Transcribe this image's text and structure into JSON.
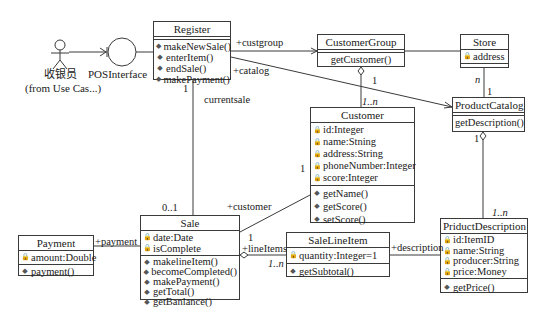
{
  "actor": {
    "name": "收银员",
    "note": "(from Use Cas...)"
  },
  "interface": {
    "name": "POSInterface"
  },
  "classes": {
    "register": {
      "name": "Register",
      "attributes": [],
      "operations": [
        "makeNewSale()",
        "enterItem()",
        "endSale()",
        "makePayment()"
      ]
    },
    "customer_group": {
      "name": "CustomerGroup",
      "attributes": [],
      "operations": [
        "getCustomer()"
      ]
    },
    "store": {
      "name": "Store",
      "attributes": [
        "address"
      ],
      "operations": []
    },
    "product_catalog": {
      "name": "ProductCatalog",
      "attributes": [],
      "operations": [
        "getDescription()"
      ]
    },
    "customer": {
      "name": "Customer",
      "attributes": [
        "id:Integer",
        "name:Stning",
        "address:String",
        "phoneNumber:Integer",
        "score:Integer"
      ],
      "operations": [
        "getName()",
        "getScore()",
        "setScore()"
      ]
    },
    "sale": {
      "name": "Sale",
      "attributes": [
        "date:Date",
        "isComplete"
      ],
      "operations": [
        "makelineItem()",
        "becomeCompleted()",
        "makePayment()",
        "getTotal()",
        "getBanlance()"
      ]
    },
    "payment": {
      "name": "Payment",
      "attributes": [
        "amount:Double"
      ],
      "operations": [
        "payment()"
      ]
    },
    "sale_line_item": {
      "name": "SaleLineItem",
      "attributes": [
        "quantity:Integer=1"
      ],
      "operations": [
        "getSubtotal()"
      ]
    },
    "product_description": {
      "name": "PriductDescription",
      "attributes": [
        "id:ItemID",
        "name:String",
        "producer:String",
        "price:Money"
      ],
      "operations": [
        "getPrice()"
      ]
    }
  },
  "labels": {
    "custgroup": "+custgroup",
    "catalog": "+catalog",
    "currentsale": "currentsale",
    "reg_mult": "1",
    "sale_mult": "0..1",
    "cg_mult": "1",
    "cust_mult": "1..n",
    "store_n": "n",
    "pc_mult": "1",
    "pc_bottom": "1",
    "pd_mult": "1..n",
    "customer_role": "+customer",
    "customer_mult": "1",
    "payment_role": "+payment",
    "lineitems_role": "+lineItems",
    "lineitems_one": "1",
    "lineitems_many": "1..n",
    "description_role": "+description"
  },
  "icons": {
    "attribute": "lock-icon",
    "operation": "method-icon"
  }
}
